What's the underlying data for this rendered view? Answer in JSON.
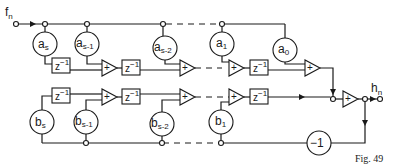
{
  "diagram": {
    "input_label": "f",
    "input_sub": "n",
    "output_label": "h",
    "output_sub": "n",
    "figure_caption": "Fig. 49",
    "delay_label": "z",
    "delay_exp": "−1",
    "adder_symbol": "+",
    "inverter_label": "−1",
    "a_coefficients": [
      {
        "base": "a",
        "sub": "s"
      },
      {
        "base": "a",
        "sub": "s-1"
      },
      {
        "base": "a",
        "sub": "s-2"
      },
      {
        "base": "a",
        "sub": "1"
      },
      {
        "base": "a",
        "sub": "0"
      }
    ],
    "b_coefficients": [
      {
        "base": "b",
        "sub": "s"
      },
      {
        "base": "b",
        "sub": "s-1"
      },
      {
        "base": "b",
        "sub": "s-2"
      },
      {
        "base": "b",
        "sub": "1"
      }
    ]
  }
}
